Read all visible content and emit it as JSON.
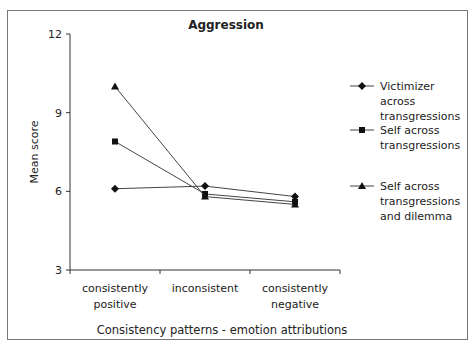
{
  "chart_data": {
    "type": "line",
    "title": "Aggression",
    "xlabel": "Consistency patterns - emotion attributions",
    "ylabel": "Mean score",
    "ylim": [
      3,
      12
    ],
    "yticks": [
      3,
      6,
      9,
      12
    ],
    "categories": [
      [
        "consistently",
        "positive"
      ],
      [
        "inconsistent"
      ],
      [
        "consistently",
        "negative"
      ]
    ],
    "grid": false,
    "legend_position": "right",
    "series": [
      {
        "name": "Victimizer across transgressions",
        "legend_lines": [
          "Victimizer",
          "across",
          "transgressions"
        ],
        "marker": "diamond",
        "values": [
          6.1,
          6.2,
          5.8
        ]
      },
      {
        "name": "Self across transgressions",
        "legend_lines": [
          "Self across",
          "transgressions"
        ],
        "marker": "square",
        "values": [
          7.9,
          5.9,
          5.6
        ]
      },
      {
        "name": "Self across transgressions and dilemma",
        "legend_lines": [
          "Self across",
          "transgressions",
          "and dilemma"
        ],
        "marker": "triangle",
        "values": [
          10.0,
          5.8,
          5.5
        ]
      }
    ]
  },
  "colors": {
    "line": "#444444",
    "marker": "#111111",
    "axis": "#333333",
    "border": "#777777"
  }
}
